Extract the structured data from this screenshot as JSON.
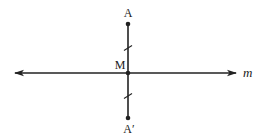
{
  "diagram": {
    "colors": {
      "line": "#222222",
      "background": "#ffffff"
    },
    "line_m": {
      "label": "m",
      "x1": 15,
      "y1": 73,
      "x2": 236,
      "y2": 73,
      "arrows": "both"
    },
    "segment": {
      "x": 128,
      "y_top": 24,
      "y_bottom": 118
    },
    "points": [
      {
        "id": "A",
        "label": "A",
        "x": 128,
        "y": 24,
        "label_x": 128,
        "label_y": 17
      },
      {
        "id": "M",
        "label": "M",
        "x": 128,
        "y": 73,
        "label_x": 118,
        "label_y": 69
      },
      {
        "id": "A_prime",
        "label": "A′",
        "x": 128,
        "y": 118,
        "label_x": 129,
        "label_y": 133
      }
    ],
    "tick_marks": [
      {
        "segment": "AM",
        "x": 128,
        "y": 48
      },
      {
        "segment": "MA'",
        "x": 128,
        "y": 96
      }
    ]
  }
}
